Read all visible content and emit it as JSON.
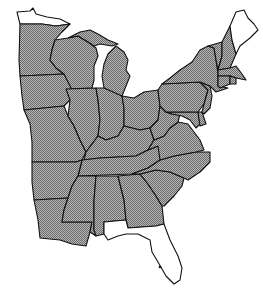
{
  "map": {
    "title": "",
    "region": "Eastern United States",
    "colors": {
      "shaded": "#9a9a9a",
      "unshaded": "#ffffff",
      "border": "#111111"
    },
    "legend": [],
    "states": [
      {
        "name": "Minnesota-north",
        "shaded": false
      },
      {
        "name": "Minnesota",
        "shaded": true
      },
      {
        "name": "Wisconsin",
        "shaded": true
      },
      {
        "name": "Michigan",
        "shaded": true
      },
      {
        "name": "Iowa",
        "shaded": true
      },
      {
        "name": "Missouri",
        "shaded": true
      },
      {
        "name": "Illinois",
        "shaded": true
      },
      {
        "name": "Indiana",
        "shaded": true
      },
      {
        "name": "Ohio",
        "shaded": true
      },
      {
        "name": "Kentucky",
        "shaded": true
      },
      {
        "name": "Tennessee",
        "shaded": true
      },
      {
        "name": "Arkansas",
        "shaded": true
      },
      {
        "name": "Louisiana",
        "shaded": true
      },
      {
        "name": "Mississippi",
        "shaded": true
      },
      {
        "name": "Alabama",
        "shaded": true
      },
      {
        "name": "Georgia",
        "shaded": true
      },
      {
        "name": "Florida",
        "shaded": false
      },
      {
        "name": "South Carolina",
        "shaded": true
      },
      {
        "name": "North Carolina",
        "shaded": true
      },
      {
        "name": "Virginia",
        "shaded": true
      },
      {
        "name": "West Virginia",
        "shaded": true
      },
      {
        "name": "Maryland",
        "shaded": true
      },
      {
        "name": "Delaware",
        "shaded": true
      },
      {
        "name": "Pennsylvania",
        "shaded": true
      },
      {
        "name": "New Jersey",
        "shaded": true
      },
      {
        "name": "New York",
        "shaded": true
      },
      {
        "name": "Vermont",
        "shaded": true
      },
      {
        "name": "New Hampshire",
        "shaded": true
      },
      {
        "name": "Maine",
        "shaded": false
      },
      {
        "name": "Massachusetts",
        "shaded": true
      },
      {
        "name": "Connecticut",
        "shaded": true
      },
      {
        "name": "Rhode Island",
        "shaded": true
      }
    ]
  }
}
